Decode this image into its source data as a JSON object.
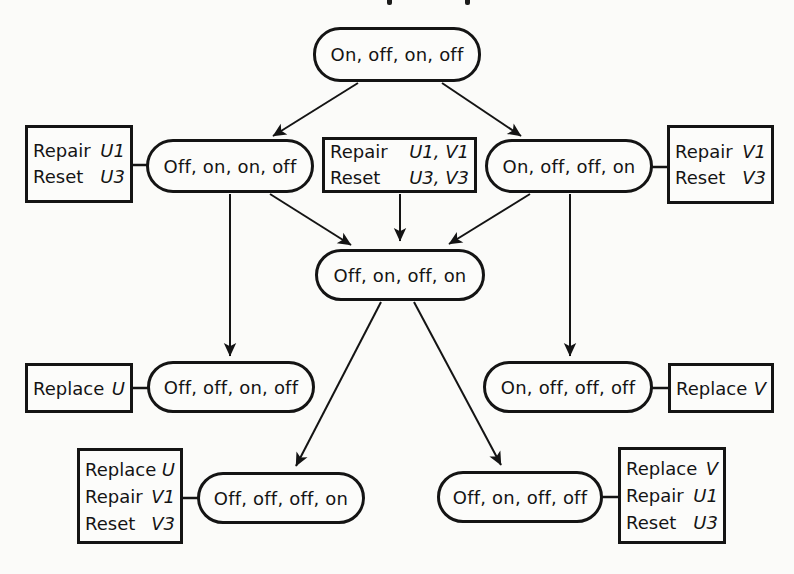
{
  "colors": {
    "ink": "#141414",
    "paper": "#fbfbf9"
  },
  "states": [
    {
      "label": "On, off, on, off"
    },
    {
      "label": "Off, on, on, off"
    },
    {
      "label": "On, off, off, on"
    },
    {
      "label": "Off, on, off, on"
    },
    {
      "label": "Off, off, on, off"
    },
    {
      "label": "On, off, off, off"
    },
    {
      "label": "Off, off, off, on"
    },
    {
      "label": "Off, on, off, off"
    }
  ],
  "action_boxes": [
    {
      "lines": [
        {
          "action": "Repair",
          "vars": "U1"
        },
        {
          "action": "Reset",
          "vars": "U3"
        }
      ]
    },
    {
      "lines": [
        {
          "action": "Repair",
          "vars": "U1, V1"
        },
        {
          "action": "Reset",
          "vars": "U3, V3"
        }
      ]
    },
    {
      "lines": [
        {
          "action": "Repair",
          "vars": "V1"
        },
        {
          "action": "Reset",
          "vars": "V3"
        }
      ]
    },
    {
      "lines": [
        {
          "action": "Replace",
          "vars": "U"
        }
      ]
    },
    {
      "lines": [
        {
          "action": "Replace",
          "vars": "V"
        }
      ]
    },
    {
      "lines": [
        {
          "action": "Replace",
          "vars": "U"
        },
        {
          "action": "Repair",
          "vars": "V1"
        },
        {
          "action": "Reset",
          "vars": "V3"
        }
      ]
    },
    {
      "lines": [
        {
          "action": "Replace",
          "vars": "V"
        },
        {
          "action": "Repair",
          "vars": "U1"
        },
        {
          "action": "Reset",
          "vars": "U3"
        }
      ]
    }
  ]
}
